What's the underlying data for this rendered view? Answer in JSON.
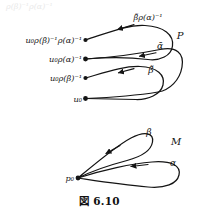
{
  "figure": {
    "caption": "図 6.10",
    "bleed_text": "ρ(β)⁻¹ρ(α)⁻¹",
    "upper_diagram": {
      "space_label": "P",
      "basepoint_labels": [
        "u₀ρ(β)⁻¹ρ(α)⁻¹",
        "u₀ρ(α)⁻¹",
        "u₀ρ(β)⁻¹",
        "u₀"
      ],
      "path_labels": [
        "β̃ρ(α)⁻¹",
        "ᾱ",
        "β̃"
      ]
    },
    "lower_diagram": {
      "space_label": "M",
      "basepoint_label": "p₀",
      "loop_labels": [
        "β",
        "α"
      ]
    },
    "colors": {
      "ink": "#141414",
      "background": "#ffffff"
    }
  }
}
